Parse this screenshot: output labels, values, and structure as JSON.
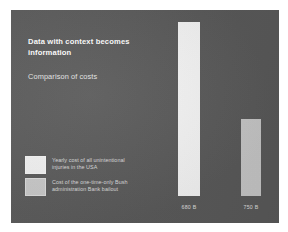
{
  "slide": {
    "title": "Data with context becomes information",
    "subtitle": "Comparison of costs",
    "background_color": "#5a5a5a"
  },
  "legend": {
    "items": [
      {
        "swatch_color": "#f2f2f2",
        "line1": "Yearly cost of all unintentional",
        "line2": "injuries in the USA"
      },
      {
        "swatch_color": "#c9c9c9",
        "line1": "Cost of the one-time-only Bush",
        "line2": "administration Bank bailout"
      }
    ]
  },
  "chart_data": {
    "type": "bar",
    "title": "Comparison of costs",
    "xlabel": "",
    "ylabel": "",
    "categories": [
      "Yearly cost of all unintentional injuries in the USA",
      "Cost of the one-time-only Bush administration Bank bailout"
    ],
    "values": [
      680,
      750
    ],
    "value_labels": [
      "680 B",
      "750 B"
    ],
    "units": "Billions of US dollars",
    "ylim": [
      0,
      1000
    ],
    "grid": false,
    "legend_position": "left-bottom",
    "colors": [
      "#f7f7f7",
      "#c9c9c9"
    ]
  }
}
